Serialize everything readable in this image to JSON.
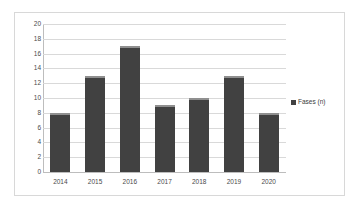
{
  "chart_data": {
    "type": "bar",
    "title": "",
    "xlabel": "",
    "ylabel": "",
    "categories": [
      "2014",
      "2015",
      "2016",
      "2017",
      "2018",
      "2019",
      "2020"
    ],
    "series": [
      {
        "name": "Fases (n)",
        "values": [
          8,
          13,
          17,
          9,
          10,
          13,
          8
        ],
        "color": "#414141"
      }
    ],
    "ylim": [
      0,
      20
    ],
    "ytick_step": 2,
    "yticks": [
      20,
      18,
      16,
      14,
      12,
      10,
      8,
      6,
      4,
      2,
      0
    ],
    "grid": true,
    "legend_position": "right"
  },
  "legend": {
    "entries": [
      {
        "label": "Fases (n)",
        "marker": "legend-swatch"
      }
    ]
  },
  "colors": {
    "bar": "#414141",
    "bar_cap": "#8f8f8f",
    "gridline": "#d9d9d9",
    "axis": "#bdbdbd",
    "frame_border": "#d8d8d8",
    "background": "#ffffff",
    "tick_text": "#4a4a4a"
  }
}
